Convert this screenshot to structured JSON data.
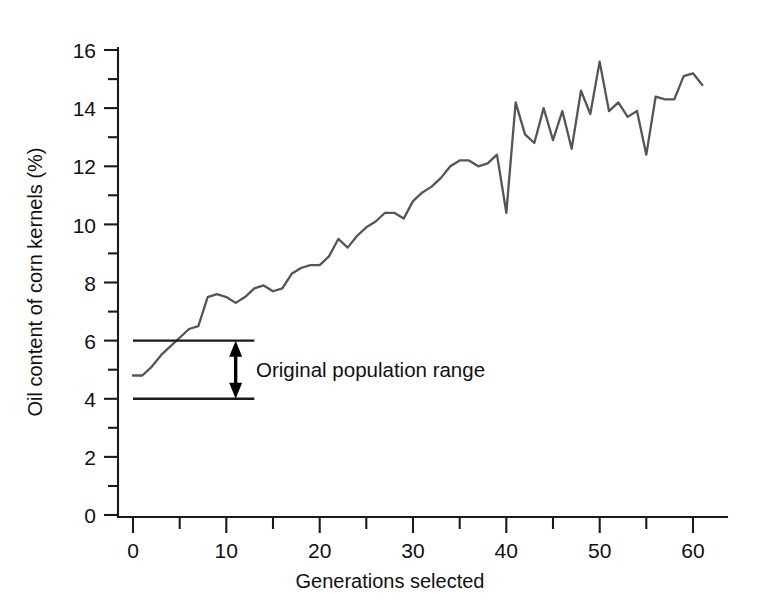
{
  "chart_data": {
    "type": "line",
    "title": "",
    "xlabel": "Generations selected",
    "ylabel": "Oil content of corn kernels (%)",
    "xlim": [
      -1.5,
      64
    ],
    "ylim": [
      0,
      16.6
    ],
    "xticks": [
      0,
      10,
      20,
      30,
      40,
      50,
      60
    ],
    "xticks_minor": [
      5,
      15,
      25,
      35,
      45,
      55
    ],
    "yticks": [
      0,
      2,
      4,
      6,
      8,
      10,
      12,
      14,
      16
    ],
    "yticks_minor": [
      1,
      3,
      5,
      7,
      9,
      11,
      13,
      15
    ],
    "grid": false,
    "legend": null,
    "line_color": "#555555",
    "axis_color": "#1a1a1a",
    "series": [
      {
        "name": "Oil content of corn kernels",
        "x": [
          0,
          1,
          2,
          3,
          4,
          5,
          6,
          7,
          8,
          9,
          10,
          11,
          12,
          13,
          14,
          15,
          16,
          17,
          18,
          19,
          20,
          21,
          22,
          23,
          24,
          25,
          26,
          27,
          28,
          29,
          30,
          31,
          32,
          33,
          34,
          35,
          36,
          37,
          38,
          39,
          40,
          41,
          42,
          43,
          44,
          45,
          46,
          47,
          48,
          49,
          50,
          51,
          52,
          53,
          54,
          55,
          56,
          57,
          58,
          59,
          60,
          61
        ],
        "values": [
          4.8,
          4.8,
          5.1,
          5.5,
          5.8,
          6.1,
          6.4,
          6.5,
          7.5,
          7.6,
          7.5,
          7.3,
          7.5,
          7.8,
          7.9,
          7.7,
          7.8,
          8.3,
          8.5,
          8.6,
          8.6,
          8.9,
          9.5,
          9.2,
          9.6,
          9.9,
          10.1,
          10.4,
          10.4,
          10.2,
          10.8,
          11.1,
          11.3,
          11.6,
          12.0,
          12.2,
          12.2,
          12.0,
          12.1,
          12.4,
          10.4,
          14.2,
          13.1,
          12.8,
          14.0,
          12.9,
          13.9,
          12.6,
          14.6,
          13.8,
          15.6,
          13.9,
          14.2,
          13.7,
          13.9,
          12.4,
          14.4,
          14.3,
          14.3,
          15.1,
          15.2,
          14.8
        ]
      }
    ],
    "annotations": [
      {
        "name": "original-population-range",
        "label": "Original population range",
        "upper_value": 6.0,
        "lower_value": 4.0,
        "x_start": 0,
        "x_end": 13,
        "arrow_x": 11
      }
    ]
  },
  "labels": {
    "y_axis_title": "Oil content of corn kernels (%)",
    "x_axis_title": "Generations selected",
    "annotation_text": "Original population range"
  },
  "y_tick_labels": [
    "0",
    "2",
    "4",
    "6",
    "8",
    "10",
    "12",
    "14",
    "16"
  ],
  "x_tick_labels": [
    "0",
    "10",
    "20",
    "30",
    "40",
    "50",
    "60"
  ]
}
